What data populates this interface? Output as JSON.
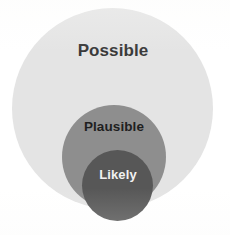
{
  "figure": {
    "type": "nested-euler-diagram",
    "background_color": "#ffffff",
    "levels": [
      {
        "id": "possible",
        "label": "Possible",
        "fill_color": "#e4e4e4",
        "text_color": "#3a3a3a",
        "rank": 1
      },
      {
        "id": "plausible",
        "label": "Plausible",
        "fill_color": "#8e8e8e",
        "text_color": "#1f1f1f",
        "rank": 2
      },
      {
        "id": "likely",
        "label": "Likely",
        "fill_color": "#575757",
        "text_color": "#f2f2f2",
        "rank": 3
      }
    ]
  },
  "chart_data": {
    "type": "pie",
    "title": "",
    "subtitle": "",
    "xlabel": "",
    "ylabel": "",
    "legend_position": "none",
    "grid": false,
    "categories": [
      "Possible",
      "Plausible",
      "Likely"
    ],
    "values": [
      201,
      104,
      71
    ],
    "value_units": "circle diameter in pixels",
    "series": [
      {
        "name": "nested set diameter",
        "values": [
          201,
          104,
          71
        ]
      }
    ],
    "annotations": [
      {
        "text": "Possible",
        "set": "outer"
      },
      {
        "text": "Plausible",
        "set": "middle"
      },
      {
        "text": "Likely",
        "set": "inner"
      }
    ],
    "nesting": "Likely is a subset of Plausible, which is a subset of Possible"
  }
}
